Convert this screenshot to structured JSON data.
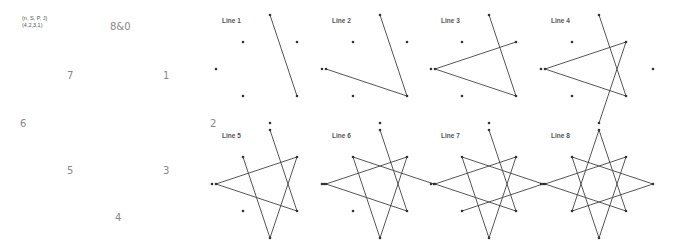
{
  "legend": {
    "line1": "(n, S, P, J)",
    "line2": "(4,2,3,1)"
  },
  "numbers": [
    {
      "label": "8&0",
      "x": 110,
      "y": 21
    },
    {
      "label": "7",
      "x": 67,
      "y": 70
    },
    {
      "label": "1",
      "x": 163,
      "y": 70
    },
    {
      "label": "6",
      "x": 20,
      "y": 118
    },
    {
      "label": "2",
      "x": 210,
      "y": 118
    },
    {
      "label": "5",
      "x": 67,
      "y": 165
    },
    {
      "label": "3",
      "x": 163,
      "y": 165
    },
    {
      "label": "4",
      "x": 115,
      "y": 212
    }
  ],
  "panels": [
    {
      "label": "Line 1"
    },
    {
      "label": "Line 2"
    },
    {
      "label": "Line 3"
    },
    {
      "label": "Line 4"
    },
    {
      "label": "Line 5"
    },
    {
      "label": "Line 6"
    },
    {
      "label": "Line 7"
    },
    {
      "label": "Line 8"
    }
  ],
  "star": {
    "description": "8-point star {8/3} built one line at a time",
    "sequence": [
      "top",
      "lower-right",
      "left",
      "upper-right",
      "bottom",
      "upper-left",
      "lower-right-far",
      "lower-left",
      "top"
    ],
    "line_color": "#444444",
    "dot_color": "#333333"
  }
}
